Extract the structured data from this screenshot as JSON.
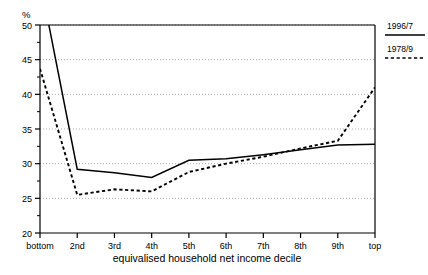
{
  "chart_data": {
    "type": "line",
    "title": "",
    "xlabel": "equivalised household net income decile",
    "ylabel": "%",
    "categories": [
      "bottom",
      "2nd",
      "3rd",
      "4th",
      "5th",
      "6th",
      "7th",
      "8th",
      "9th",
      "top"
    ],
    "ylim": [
      20,
      50
    ],
    "yticks": [
      20,
      25,
      30,
      35,
      40,
      45,
      50
    ],
    "ytick_labels": [
      "20",
      "25",
      "30",
      "35",
      "40",
      "45",
      "50"
    ],
    "minor_yticks": [
      22.5,
      27.5,
      32.5,
      37.5,
      42.5,
      47.5
    ],
    "grid": "horizontal-dotted",
    "legend_position": "top-right-outside",
    "series": [
      {
        "name": "1996/7",
        "style": "solid",
        "color": "#000000",
        "values": [
          56.5,
          29.2,
          28.7,
          28.0,
          30.5,
          30.7,
          31.3,
          32.0,
          32.7,
          32.8
        ],
        "clipped_at_top": true
      },
      {
        "name": "1978/9",
        "style": "dotted",
        "color": "#000000",
        "values": [
          43.7,
          25.5,
          26.3,
          26.0,
          28.8,
          30.0,
          31.0,
          32.2,
          33.3,
          41.0
        ],
        "clipped_at_top": false
      }
    ]
  },
  "axis": {
    "unit": "%"
  },
  "legend": {
    "entries": [
      {
        "label": "1996/7",
        "style": "solid"
      },
      {
        "label": "1978/9",
        "style": "dotted"
      }
    ]
  }
}
